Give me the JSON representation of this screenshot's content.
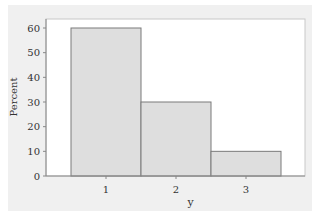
{
  "chart_data": {
    "type": "bar",
    "title": "",
    "xlabel": "y",
    "ylabel": "Percent",
    "categories": [
      "1",
      "2",
      "3"
    ],
    "values": [
      60,
      30,
      10
    ],
    "ylim": [
      0,
      60
    ],
    "yticks": [
      0,
      10,
      20,
      30,
      40,
      50,
      60
    ],
    "grid": false,
    "legend": null,
    "colors": {
      "bar_fill": "#dedede",
      "bar_stroke": "#7a7a7a",
      "panel_bg": "#f0f0f0",
      "plot_bg": "#ffffff"
    }
  }
}
